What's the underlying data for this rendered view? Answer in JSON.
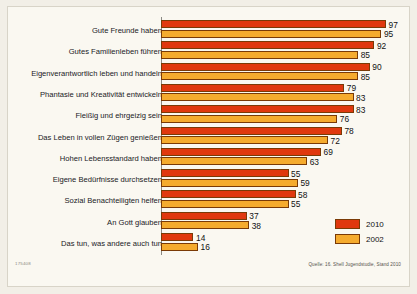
{
  "chart_data": {
    "type": "bar",
    "orientation": "horizontal",
    "title": "",
    "xlabel": "",
    "ylabel": "",
    "xlim": [
      0,
      100
    ],
    "grid": false,
    "legend_position": "bottom-right",
    "categories": [
      "Gute Freunde haben",
      "Gutes Familienleben führen",
      "Eigenverantwortlich leben und handeln",
      "Phantasie und Kreativität entwickeln",
      "Fleißig und ehrgeizig sein",
      "Das Leben in vollen Zügen genießen",
      "Hohen Lebensstandard haben",
      "Eigene Bedürfnisse durchsetzen",
      "Sozial Benachteiligten helfen",
      "An Gott glauben",
      "Das tun, was andere auch tun"
    ],
    "series": [
      {
        "name": "2010",
        "color": "#e0380e",
        "values": [
          97,
          92,
          90,
          79,
          83,
          78,
          69,
          55,
          58,
          37,
          14
        ]
      },
      {
        "name": "2002",
        "color": "#f5ab2e",
        "values": [
          95,
          85,
          85,
          83,
          76,
          72,
          63,
          59,
          55,
          38,
          16
        ]
      }
    ]
  },
  "legend": {
    "items": [
      {
        "label": "2010",
        "color": "#e0380e"
      },
      {
        "label": "2002",
        "color": "#f5ab2e"
      }
    ]
  },
  "footer": {
    "source": "Quelle: 16. Shell Jugendstudie, Stand 2010",
    "doc_id": "175408"
  }
}
